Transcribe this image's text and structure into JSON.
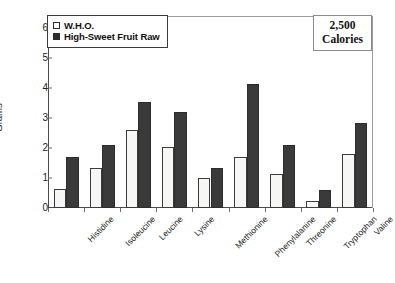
{
  "chart_data": {
    "type": "bar",
    "title": "",
    "xlabel": "",
    "ylabel": "Grams",
    "ylim": [
      0,
      6.4
    ],
    "yticks": [
      0,
      1,
      2,
      3,
      4,
      5,
      6
    ],
    "ytick_labels": [
      "0",
      "1",
      "2",
      "3",
      "4",
      "5",
      "6"
    ],
    "grid": false,
    "legend_position": "top-left",
    "categories": [
      "Histidine",
      "Isoleucine",
      "Leucine",
      "Lysine",
      "Methionine",
      "Phenylalanine",
      "Threonine",
      "Tryptophan",
      "Valine"
    ],
    "series": [
      {
        "name": "W.H.O.",
        "color": "#f6f6f4",
        "values": [
          0.65,
          1.35,
          2.6,
          2.05,
          1.0,
          1.7,
          1.15,
          0.25,
          1.8
        ]
      },
      {
        "name": "High-Sweet Fruit Raw",
        "color": "#3a3a3a",
        "values": [
          1.7,
          2.1,
          3.55,
          3.2,
          1.35,
          4.15,
          2.1,
          0.6,
          2.85
        ]
      }
    ],
    "annotations": [
      {
        "name": "calories-note",
        "lines": [
          "2,500",
          "Calories"
        ]
      }
    ]
  },
  "legend": {
    "items": [
      {
        "label": "W.H.O.",
        "swatch": "open-square-swatch"
      },
      {
        "label": "High-Sweet Fruit Raw",
        "swatch": "filled-square-swatch"
      }
    ]
  },
  "annotation_box": {
    "line1": "2,500",
    "line2": "Calories"
  },
  "axes": {
    "y_title": "Grams"
  }
}
